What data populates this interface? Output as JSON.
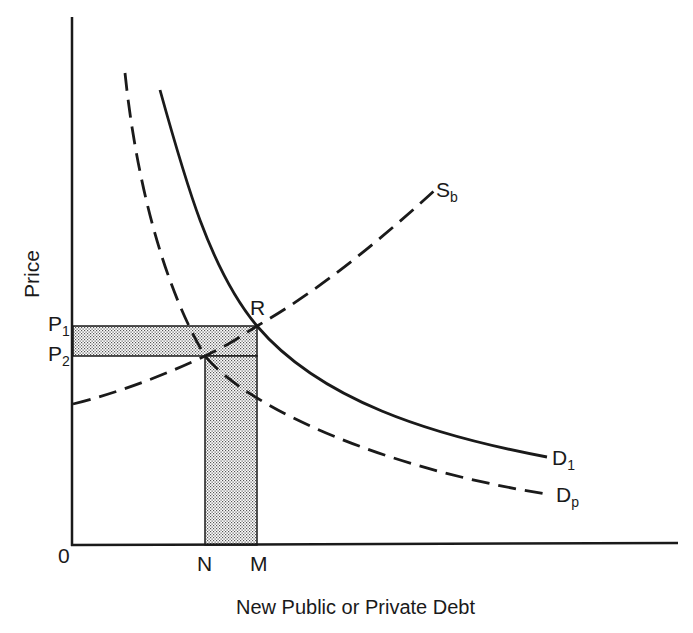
{
  "diagram": {
    "type": "supply-demand",
    "xlabel": "New Public or Private Debt",
    "ylabel": "Price",
    "origin_label": "0",
    "curves": [
      {
        "id": "Sb",
        "label_main": "S",
        "label_sub": "b",
        "style": "dashed",
        "kind": "supply"
      },
      {
        "id": "D1",
        "label_main": "D",
        "label_sub": "1",
        "style": "solid",
        "kind": "demand"
      },
      {
        "id": "Dp",
        "label_main": "D",
        "label_sub": "p",
        "style": "dashed",
        "kind": "demand"
      }
    ],
    "points": {
      "R": "R"
    },
    "price_levels": [
      {
        "main": "P",
        "sub": "1"
      },
      {
        "main": "P",
        "sub": "2"
      }
    ],
    "quantity_levels": [
      "N",
      "M"
    ],
    "shaded_region": "stippled L-shaped area between P1/P2 and N/M"
  },
  "colors": {
    "line": "#1a1a1a",
    "background": "#ffffff",
    "stipple": "#9a9a9a"
  }
}
